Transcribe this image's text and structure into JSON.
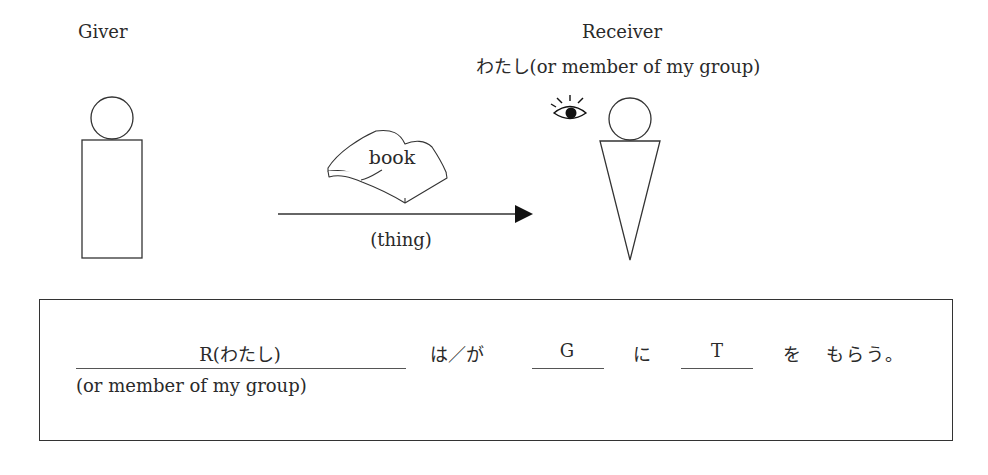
{
  "giver": {
    "label": "Giver"
  },
  "receiver": {
    "label": "Receiver",
    "sublabel": "わたし(or member of my group)"
  },
  "thing": {
    "object_label": "book",
    "arrow_label": "(thing)"
  },
  "icons": {
    "eye": "eye-icon",
    "book": "book-icon"
  },
  "pattern": {
    "receiver_slot": "R(わたし)",
    "receiver_note": "(or member of my group)",
    "particle_topic": "は／が",
    "giver_slot": "G",
    "particle_ni": "に",
    "thing_slot": "T",
    "particle_wo": "を",
    "verb": "もらう。"
  }
}
